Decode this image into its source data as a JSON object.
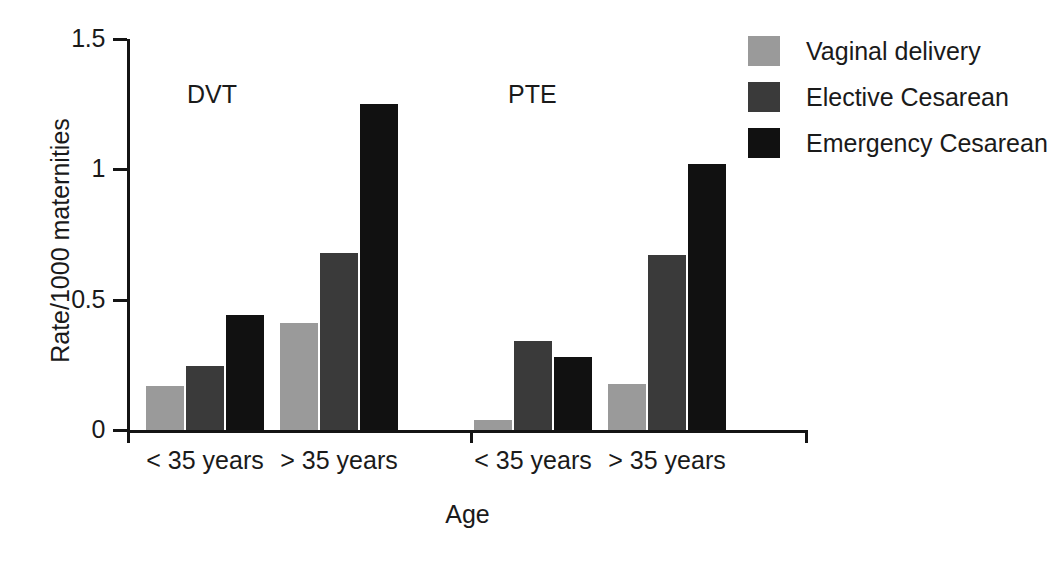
{
  "chart_data": {
    "type": "bar",
    "title": "",
    "xlabel": "Age",
    "ylabel": "Rate/1000 maternities",
    "ylim": [
      0,
      1.5
    ],
    "yticks": [
      0,
      0.5,
      1,
      1.5
    ],
    "ytick_labels": [
      "0",
      "0.5",
      "1",
      "1.5"
    ],
    "grid": false,
    "legend_position": "top-right",
    "panels": [
      "DVT",
      "PTE"
    ],
    "categories": [
      "< 35 years",
      "> 35 years"
    ],
    "series": [
      {
        "name": "Vaginal delivery",
        "color": "#9a9a9a",
        "values_by_panel": {
          "DVT": [
            0.17,
            0.41
          ],
          "PTE": [
            0.04,
            0.175
          ]
        }
      },
      {
        "name": "Elective Cesarean",
        "color": "#3a3a3a",
        "values_by_panel": {
          "DVT": [
            0.245,
            0.68
          ],
          "PTE": [
            0.34,
            0.67
          ]
        }
      },
      {
        "name": "Emergency Cesarean",
        "color": "#111111",
        "values_by_panel": {
          "DVT": [
            0.44,
            1.25
          ],
          "PTE": [
            0.28,
            1.02
          ]
        }
      }
    ],
    "bars": [
      {
        "panel": "DVT",
        "category": "< 35 years",
        "series": "Vaginal delivery",
        "value": 0.17,
        "color": "#9a9a9a",
        "x": 146,
        "width": 38
      },
      {
        "panel": "DVT",
        "category": "< 35 years",
        "series": "Elective Cesarean",
        "value": 0.245,
        "color": "#3a3a3a",
        "x": 186,
        "width": 38
      },
      {
        "panel": "DVT",
        "category": "< 35 years",
        "series": "Emergency Cesarean",
        "value": 0.44,
        "color": "#111111",
        "x": 226,
        "width": 38
      },
      {
        "panel": "DVT",
        "category": "> 35 years",
        "series": "Vaginal delivery",
        "value": 0.41,
        "color": "#9a9a9a",
        "x": 280,
        "width": 38
      },
      {
        "panel": "DVT",
        "category": "> 35 years",
        "series": "Elective Cesarean",
        "value": 0.68,
        "color": "#3a3a3a",
        "x": 320,
        "width": 38
      },
      {
        "panel": "DVT",
        "category": "> 35 years",
        "series": "Emergency Cesarean",
        "value": 1.25,
        "color": "#111111",
        "x": 360,
        "width": 38
      },
      {
        "panel": "PTE",
        "category": "< 35 years",
        "series": "Vaginal delivery",
        "value": 0.04,
        "color": "#9a9a9a",
        "x": 474,
        "width": 38
      },
      {
        "panel": "PTE",
        "category": "< 35 years",
        "series": "Elective Cesarean",
        "value": 0.34,
        "color": "#3a3a3a",
        "x": 514,
        "width": 38
      },
      {
        "panel": "PTE",
        "category": "< 35 years",
        "series": "Emergency Cesarean",
        "value": 0.28,
        "color": "#111111",
        "x": 554,
        "width": 38
      },
      {
        "panel": "PTE",
        "category": "> 35 years",
        "series": "Vaginal delivery",
        "value": 0.175,
        "color": "#9a9a9a",
        "x": 608,
        "width": 38
      },
      {
        "panel": "PTE",
        "category": "> 35 years",
        "series": "Elective Cesarean",
        "value": 0.67,
        "color": "#3a3a3a",
        "x": 648,
        "width": 38
      },
      {
        "panel": "PTE",
        "category": "> 35 years",
        "series": "Emergency Cesarean",
        "value": 1.02,
        "color": "#111111",
        "x": 688,
        "width": 38
      }
    ]
  },
  "axes": {
    "y_title": "Rate/1000 maternities",
    "x_title": "Age",
    "y_ticks": [
      {
        "label": "1.5",
        "value": 1.5
      },
      {
        "label": "1",
        "value": 1.0
      },
      {
        "label": "0.5",
        "value": 0.5
      },
      {
        "label": "0",
        "value": 0.0
      }
    ]
  },
  "panel_labels": [
    {
      "text": "DVT",
      "x": 187,
      "y": 80
    },
    {
      "text": "PTE",
      "x": 508,
      "y": 80
    }
  ],
  "group_labels": [
    {
      "text": "< 35 years",
      "center": 205
    },
    {
      "text": "> 35 years",
      "center": 339
    },
    {
      "text": "< 35 years",
      "center": 533
    },
    {
      "text": "> 35 years",
      "center": 667
    }
  ],
  "legend": {
    "items": [
      {
        "label": "Vaginal delivery",
        "color": "#9a9a9a"
      },
      {
        "label": "Elective Cesarean",
        "color": "#3a3a3a"
      },
      {
        "label": "Emergency Cesarean",
        "color": "#111111"
      }
    ]
  }
}
